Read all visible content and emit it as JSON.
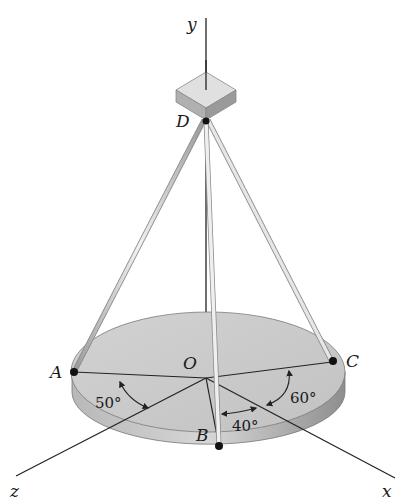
{
  "figure": {
    "axes": {
      "x": "x",
      "y": "y",
      "z": "z"
    },
    "points": {
      "origin": "O",
      "top": "D",
      "a": "A",
      "b": "B",
      "c": "C"
    },
    "angles": {
      "a_to_z": "50°",
      "z_to_b": "40°",
      "x_to_c": "60°"
    },
    "colors": {
      "disc_top": "#c9c9c9",
      "disc_side": "#a8a8a8",
      "cable": "#d4d4d4",
      "line": "#222222",
      "block": "#bdbdbd"
    }
  }
}
